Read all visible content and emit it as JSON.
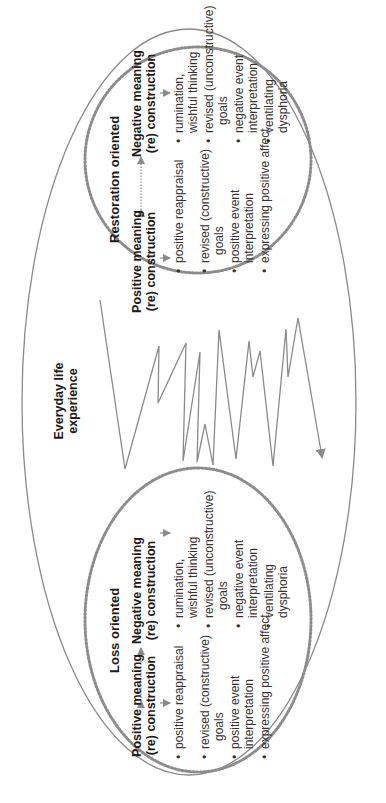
{
  "diagram": {
    "center_label": [
      "Everyday life",
      "experience"
    ],
    "colors": {
      "line": "#8a8a8a",
      "dotted": "#8c8c8c",
      "text": "#1a1a1a"
    },
    "loss": {
      "title": "Loss oriented",
      "positive": {
        "heading": [
          "Positive meaning",
          "(re) construction"
        ],
        "items": [
          [
            "positive reappraisal"
          ],
          [
            "revised (constructive)",
            "goals"
          ],
          [
            "positive event",
            "interpretation"
          ],
          [
            "expressing positive affect"
          ]
        ]
      },
      "negative": {
        "heading": [
          "Negative meaning",
          "(re) construction"
        ],
        "items": [
          [
            "rumination,",
            "wishful thinking"
          ],
          [
            "revised (unconstructive)",
            "goals"
          ],
          [
            "negative event",
            "interpretation"
          ],
          [
            "ventilating",
            "dysphoria"
          ]
        ]
      }
    },
    "restoration": {
      "title": "Restoration oriented",
      "positive": {
        "heading": [
          "Positive meaning",
          "(re) construction"
        ],
        "items": [
          [
            "positive reappraisal"
          ],
          [
            "revised (constructive)",
            "goals"
          ],
          [
            "positive event",
            "interpretation"
          ],
          [
            "expressing positive affect"
          ]
        ]
      },
      "negative": {
        "heading": [
          "Negative meaning",
          "(re) construction"
        ],
        "items": [
          [
            "rumination,",
            "wishful thinking"
          ],
          [
            "revised (unconstructive)",
            "goals"
          ],
          [
            "negative event",
            "interpretation"
          ],
          [
            "ventilating",
            "dysphoria"
          ]
        ]
      }
    },
    "bullet": "•"
  }
}
